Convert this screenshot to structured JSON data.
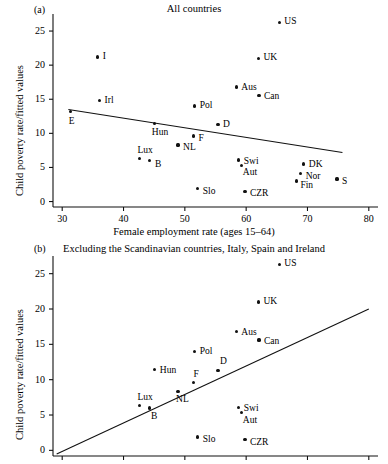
{
  "figure": {
    "background": "#ffffff",
    "ink": "#111111"
  },
  "panels": [
    {
      "tag": "(a)",
      "title": "All countries",
      "ylabel": "Child poverty rate/fitted values",
      "xlabel": "Female employment rate (ages 15–64)",
      "chart_data": {
        "type": "scatter",
        "title": "All countries",
        "xlabel": "Female employment rate (ages 15–64)",
        "ylabel": "Child poverty rate/fitted values",
        "xlim": [
          28.5,
          81.5
        ],
        "ylim": [
          -0.8,
          27.5
        ],
        "xticks": [
          30,
          40,
          50,
          60,
          70,
          80
        ],
        "yticks": [
          0,
          5,
          10,
          15,
          20,
          25
        ],
        "grid": false,
        "legend": "none",
        "points": [
          {
            "label": "E",
            "x": 31.4,
            "y": 13.2,
            "lx": -2,
            "ly": 7
          },
          {
            "label": "I",
            "x": 35.8,
            "y": 21.2,
            "lx": 5,
            "ly": -3
          },
          {
            "label": "Irl",
            "x": 36.1,
            "y": 14.8,
            "lx": 5,
            "ly": -3
          },
          {
            "label": "B",
            "x": 44.3,
            "y": 6.0,
            "lx": 5,
            "ly": 1
          },
          {
            "label": "Lux",
            "x": 42.6,
            "y": 6.3,
            "lx": -2,
            "ly": -11
          },
          {
            "label": "Hun",
            "x": 45.1,
            "y": 11.4,
            "lx": -3,
            "ly": 6
          },
          {
            "label": "NL",
            "x": 48.9,
            "y": 8.3,
            "lx": 5,
            "ly": 0
          },
          {
            "label": "F",
            "x": 51.4,
            "y": 9.6,
            "lx": 5,
            "ly": 0
          },
          {
            "label": "Pol",
            "x": 51.6,
            "y": 14.0,
            "lx": 5,
            "ly": -3
          },
          {
            "label": "Slo",
            "x": 52.1,
            "y": 1.9,
            "lx": 5,
            "ly": 0
          },
          {
            "label": "D",
            "x": 55.4,
            "y": 11.3,
            "lx": 5,
            "ly": -2
          },
          {
            "label": "Aus",
            "x": 58.4,
            "y": 16.8,
            "lx": 5,
            "ly": -2
          },
          {
            "label": "Swi",
            "x": 58.8,
            "y": 6.1,
            "lx": 5,
            "ly": -1
          },
          {
            "label": "Aut",
            "x": 59.3,
            "y": 5.3,
            "lx": 1,
            "ly": 5
          },
          {
            "label": "CZR",
            "x": 59.8,
            "y": 1.5,
            "lx": 5,
            "ly": 0
          },
          {
            "label": "Can",
            "x": 62.1,
            "y": 15.6,
            "lx": 5,
            "ly": -1
          },
          {
            "label": "UK",
            "x": 62.0,
            "y": 21.0,
            "lx": 5,
            "ly": -3
          },
          {
            "label": "US",
            "x": 65.4,
            "y": 26.3,
            "lx": 5,
            "ly": -3
          },
          {
            "label": "Fin",
            "x": 68.2,
            "y": 3.0,
            "lx": 4,
            "ly": 2
          },
          {
            "label": "Nor",
            "x": 68.9,
            "y": 4.1,
            "lx": 5,
            "ly": 0
          },
          {
            "label": "DK",
            "x": 69.4,
            "y": 5.5,
            "lx": 5,
            "ly": -2
          },
          {
            "label": "S",
            "x": 74.8,
            "y": 3.3,
            "lx": 5,
            "ly": 0
          }
        ],
        "fit_line": {
          "x1": 31.0,
          "y1": 13.5,
          "x2": 75.7,
          "y2": 7.2
        }
      }
    },
    {
      "tag": "(b)",
      "title": "Excluding the Scandinavian countries, Italy, Spain and Ireland",
      "ylabel": "Child poverty rate/fitted values",
      "xlabel": "",
      "chart_data": {
        "type": "scatter",
        "title": "Excluding the Scandinavian countries, Italy, Spain and Ireland",
        "xlabel": "",
        "ylabel": "Child poverty rate/fitted values",
        "xlim": [
          28.5,
          81.5
        ],
        "ylim": [
          -0.8,
          27.5
        ],
        "xticks": [
          30,
          40,
          50,
          60,
          70,
          80
        ],
        "yticks": [
          0,
          5,
          10,
          15,
          20,
          25
        ],
        "grid": false,
        "legend": "none",
        "points": [
          {
            "label": "Lux",
            "x": 42.6,
            "y": 6.3,
            "lx": -2,
            "ly": -11
          },
          {
            "label": "B",
            "x": 44.3,
            "y": 6.0,
            "lx": 1,
            "ly": 6
          },
          {
            "label": "Hun",
            "x": 45.1,
            "y": 11.4,
            "lx": 5,
            "ly": -2
          },
          {
            "label": "NL",
            "x": 48.9,
            "y": 8.3,
            "lx": -2,
            "ly": 5
          },
          {
            "label": "F",
            "x": 51.4,
            "y": 9.6,
            "lx": 0,
            "ly": -11
          },
          {
            "label": "Pol",
            "x": 51.6,
            "y": 14.0,
            "lx": 5,
            "ly": -2
          },
          {
            "label": "Slo",
            "x": 52.1,
            "y": 1.9,
            "lx": 5,
            "ly": 0
          },
          {
            "label": "D",
            "x": 55.4,
            "y": 11.3,
            "lx": 2,
            "ly": -11
          },
          {
            "label": "Aus",
            "x": 58.4,
            "y": 16.8,
            "lx": 5,
            "ly": -2
          },
          {
            "label": "Swi",
            "x": 58.8,
            "y": 6.1,
            "lx": 5,
            "ly": -1
          },
          {
            "label": "Aut",
            "x": 59.3,
            "y": 5.3,
            "lx": 1,
            "ly": 5
          },
          {
            "label": "CZR",
            "x": 59.8,
            "y": 1.5,
            "lx": 5,
            "ly": 0
          },
          {
            "label": "Can",
            "x": 62.1,
            "y": 15.6,
            "lx": 5,
            "ly": -1
          },
          {
            "label": "UK",
            "x": 62.0,
            "y": 21.0,
            "lx": 5,
            "ly": -3
          },
          {
            "label": "US",
            "x": 65.4,
            "y": 26.3,
            "lx": 5,
            "ly": -3
          }
        ],
        "fit_line": {
          "x1": 29.1,
          "y1": -0.5,
          "x2": 80.0,
          "y2": 20.0
        }
      }
    }
  ]
}
